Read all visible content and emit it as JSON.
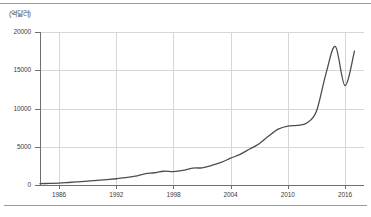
{
  "chart_data": {
    "type": "line",
    "title": "",
    "subtitle": "",
    "xlabel": "",
    "ylabel": "",
    "unit_label": "(억달러)",
    "grid": true,
    "legend": "none",
    "xlim": [
      1984,
      2018
    ],
    "ylim": [
      0,
      20000
    ],
    "x_ticks": [
      1986,
      1992,
      1998,
      2004,
      2010,
      2016
    ],
    "y_ticks": [
      0,
      5000,
      10000,
      15000,
      20000
    ],
    "y_tick_labels": [
      "0",
      "5000",
      "10000",
      "15000",
      "20000"
    ],
    "x_tick_labels": [
      "1986",
      "1992",
      "1998",
      "2004",
      "2010",
      "2016"
    ],
    "series": [
      {
        "name": "수출액",
        "color": "#4d4d4d",
        "x": [
          1984,
          1985,
          1986,
          1987,
          1988,
          1989,
          1990,
          1991,
          1992,
          1993,
          1994,
          1995,
          1996,
          1997,
          1998,
          1999,
          2000,
          2001,
          2002,
          2003,
          2004,
          2005,
          2006,
          2007,
          2008,
          2009,
          2010,
          2011,
          2012,
          2013,
          2014,
          2015,
          2016,
          2017
        ],
        "values": [
          180,
          210,
          250,
          330,
          420,
          500,
          600,
          700,
          820,
          950,
          1150,
          1450,
          1600,
          1800,
          1750,
          1900,
          2200,
          2250,
          2550,
          2950,
          3500,
          4000,
          4700,
          5400,
          6400,
          7300,
          7700,
          7800,
          8100,
          9600,
          14500,
          18100,
          13000,
          17500
        ]
      }
    ]
  }
}
